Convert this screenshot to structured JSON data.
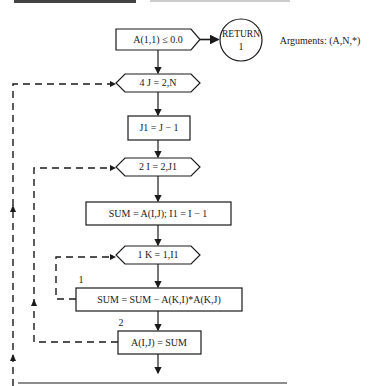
{
  "header": {
    "cut_text": "(partially cropped heading line)"
  },
  "arguments_label": "Arguments: (A,N,*)",
  "nodes": {
    "test": "A(1,1) ≤ 0.0",
    "return_top": "RETURN",
    "return_bottom": "1",
    "loop_j": "4  J = 2,N",
    "j1": "J1 = J − 1",
    "loop_i": "2  I = 2,J1",
    "sum_init": "SUM = A(I,J); I1 = I − 1",
    "loop_k": "1  K = 1,I1",
    "sum_update": "SUM = SUM − A(K,I)*A(K,J)",
    "assign": "A(I,J) = SUM"
  },
  "loop_labels": {
    "label_1": "1",
    "label_2": "2"
  },
  "colors": {
    "stroke": "#1a1a1a",
    "background": "#ffffff"
  }
}
